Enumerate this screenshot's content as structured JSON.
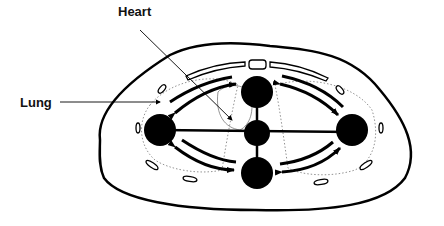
{
  "labels": {
    "heart": "Heart",
    "lung": "Lung"
  },
  "nodes": [
    {
      "id": "top",
      "name": "anterior"
    },
    {
      "id": "left",
      "name": "left-lateral"
    },
    {
      "id": "center",
      "name": "central"
    },
    {
      "id": "right",
      "name": "right-lateral"
    },
    {
      "id": "bottom",
      "name": "posterior"
    }
  ],
  "colors": {
    "stroke": "#000000",
    "fill": "#000000",
    "background": "#ffffff"
  }
}
